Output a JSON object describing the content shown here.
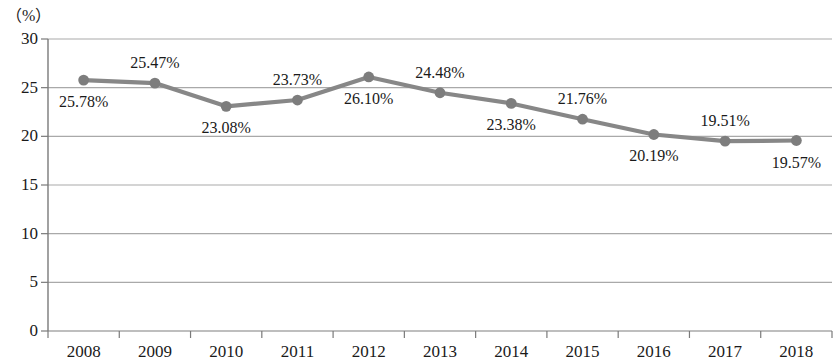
{
  "chart_data": {
    "type": "line",
    "title": "",
    "subtitle": "",
    "xlabel": "",
    "ylabel": "",
    "unit_label": "（%）",
    "categories": [
      "2008",
      "2009",
      "2010",
      "2011",
      "2012",
      "2013",
      "2014",
      "2015",
      "2016",
      "2017",
      "2018"
    ],
    "values": [
      25.78,
      25.47,
      23.08,
      23.73,
      26.1,
      24.48,
      23.38,
      21.76,
      20.19,
      19.51,
      19.57
    ],
    "point_labels": [
      "25.78%",
      "25.47%",
      "23.08%",
      "23.73%",
      "26.10%",
      "24.48%",
      "23.38%",
      "21.76%",
      "20.19%",
      "19.51%",
      "19.57%"
    ],
    "label_positions": [
      "below",
      "above",
      "below",
      "above",
      "below",
      "above",
      "below",
      "above",
      "below",
      "above",
      "below"
    ],
    "ylim": [
      0,
      30
    ],
    "yticks": [
      0,
      5,
      10,
      15,
      20,
      25,
      30
    ],
    "ytick_labels": [
      "0",
      "5",
      "10",
      "15",
      "20",
      "25",
      "30"
    ],
    "grid": true,
    "legend": "none",
    "series_color": "#878787",
    "marker_color": "#7d7d7d",
    "grid_color": "#a9a9a9",
    "axis_color": "#7a7a7a"
  }
}
